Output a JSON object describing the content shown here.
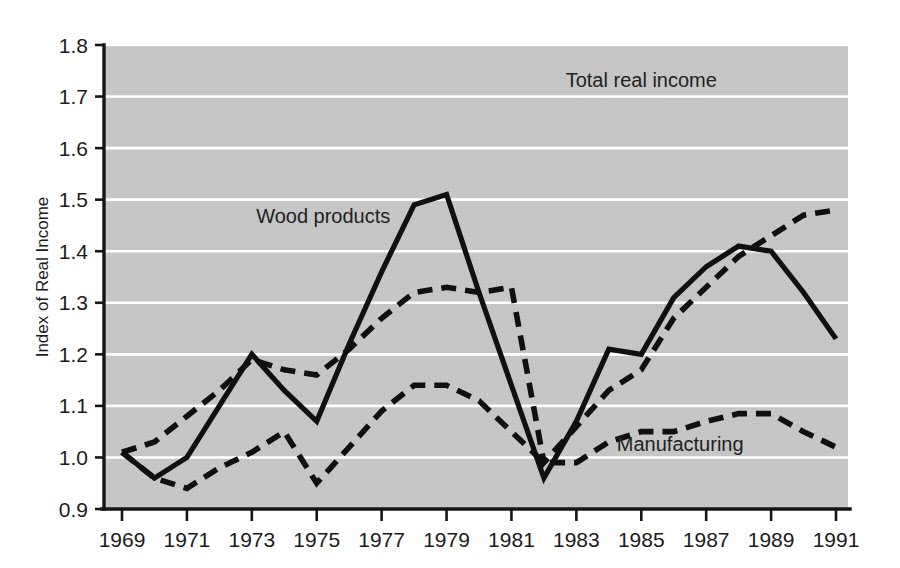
{
  "chart_data": {
    "type": "line",
    "title": "",
    "xlabel": "",
    "ylabel": "Index of Real Income",
    "xlim": [
      1969,
      1991
    ],
    "ylim": [
      0.9,
      1.8
    ],
    "grid": true,
    "legend_position": "inline-annotations",
    "x": [
      1969,
      1970,
      1971,
      1972,
      1973,
      1974,
      1975,
      1976,
      1977,
      1978,
      1979,
      1980,
      1981,
      1982,
      1983,
      1984,
      1985,
      1986,
      1987,
      1988,
      1989,
      1990,
      1991
    ],
    "xtick_labels": [
      "1969",
      "1971",
      "1973",
      "1975",
      "1977",
      "1979",
      "1981",
      "1983",
      "1985",
      "1987",
      "1989",
      "1991"
    ],
    "xtick_values": [
      1969,
      1971,
      1973,
      1975,
      1977,
      1979,
      1981,
      1983,
      1985,
      1987,
      1989,
      1991
    ],
    "ytick_labels": [
      "0.9",
      "1.0",
      "1.1",
      "1.2",
      "1.3",
      "1.4",
      "1.5",
      "1.6",
      "1.7",
      "1.8"
    ],
    "ytick_values": [
      0.9,
      1.0,
      1.1,
      1.2,
      1.3,
      1.4,
      1.5,
      1.6,
      1.7,
      1.8
    ],
    "series": [
      {
        "name": "Wood products",
        "style": "solid",
        "label_text": "Wood products",
        "values": [
          1.01,
          0.96,
          1.0,
          1.1,
          1.2,
          1.13,
          1.07,
          1.22,
          1.36,
          1.49,
          1.51,
          1.32,
          1.14,
          0.96,
          1.07,
          1.21,
          1.2,
          1.31,
          1.37,
          1.41,
          1.4,
          1.32,
          1.23
        ]
      },
      {
        "name": "Total real income",
        "style": "dashed",
        "label_text": "Total real income",
        "values": [
          1.01,
          1.03,
          1.08,
          1.13,
          1.19,
          1.17,
          1.16,
          1.21,
          1.27,
          1.32,
          1.33,
          1.32,
          1.33,
          0.99,
          1.06,
          1.13,
          1.17,
          1.27,
          1.33,
          1.39,
          1.43,
          1.47,
          1.48
        ]
      },
      {
        "name": "Manufacturing",
        "style": "dashed",
        "label_text": "Manufacturing",
        "values": [
          1.01,
          0.96,
          0.94,
          0.98,
          1.01,
          1.05,
          0.95,
          1.02,
          1.09,
          1.14,
          1.14,
          1.11,
          1.05,
          0.99,
          0.99,
          1.03,
          1.05,
          1.05,
          1.07,
          1.085,
          1.085,
          1.05,
          1.02
        ]
      }
    ],
    "colors": {
      "plot_background": "#c6c6c6",
      "gridline": "#ffffff",
      "axis": "#151515",
      "series_line": "#101010",
      "page_background": "#ffffff",
      "text": "#1b1b1b"
    }
  },
  "annotations": [
    {
      "text": "Wood products",
      "x": 1975.2,
      "y": 1.455
    },
    {
      "text": "Total real income",
      "x": 1985.0,
      "y": 1.718
    },
    {
      "text": "Manufacturing",
      "x": 1986.2,
      "y": 1.012
    }
  ]
}
